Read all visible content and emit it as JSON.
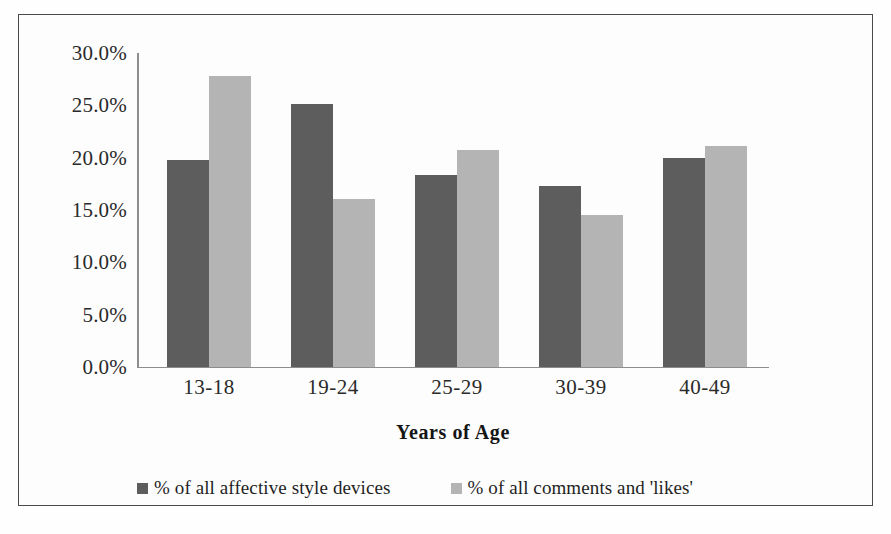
{
  "chart_data": {
    "type": "bar",
    "title": "",
    "subtitle": "",
    "xlabel": "Years of Age",
    "ylabel": "",
    "categories": [
      "13-18",
      "19-24",
      "25-29",
      "30-39",
      "40-49"
    ],
    "series": [
      {
        "name": "% of all affective style devices",
        "color": "#5d5d5d",
        "values": [
          19.8,
          25.1,
          18.3,
          17.3,
          20.0
        ]
      },
      {
        "name": "% of all comments and 'likes'",
        "color": "#b4b4b4",
        "values": [
          27.8,
          16.1,
          20.7,
          14.5,
          21.1
        ]
      }
    ],
    "ylim": [
      0,
      30
    ],
    "ytick_values": [
      30,
      25,
      20,
      15,
      10,
      5,
      0
    ],
    "ytick_labels": [
      "30.0%",
      "25.0%",
      "20.0%",
      "15.0%",
      "10.0%",
      "5.0%",
      "0.0%"
    ],
    "grid": false,
    "legend_position": "bottom"
  },
  "axis": {
    "x_title": "Years of Age"
  },
  "legend": {
    "entries": [
      {
        "label": "% of all affective style devices",
        "swatch": "dark-gray-swatch-icon"
      },
      {
        "label": "% of all comments and 'likes'",
        "swatch": "light-gray-swatch-icon"
      }
    ]
  },
  "colors": {
    "series_a": "#5d5d5d",
    "series_b": "#b4b4b4",
    "axis": "#8d8d8d",
    "frame": "#4a4a4a",
    "text": "#1f1f1f",
    "background": "#fefefe"
  }
}
